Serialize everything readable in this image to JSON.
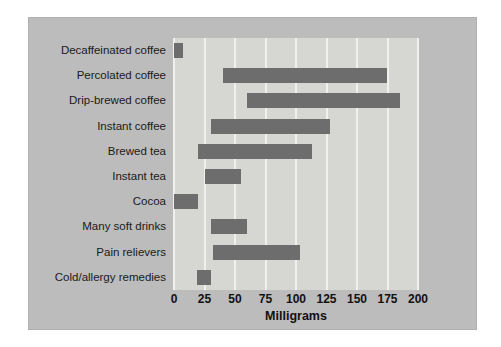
{
  "chart_data": {
    "type": "bar",
    "orientation": "horizontal",
    "subtype": "range-bar",
    "title": "",
    "xlabel": "Milligrams",
    "ylabel": "",
    "xlim": [
      0,
      200
    ],
    "xticks": [
      0,
      25,
      50,
      75,
      100,
      125,
      150,
      175,
      200
    ],
    "xtick_labels": [
      "0",
      "25",
      "50",
      "75",
      "100",
      "125",
      "150",
      "175",
      "200"
    ],
    "grid": true,
    "grid_axis": "x",
    "legend": false,
    "categories": [
      "Decaffeinated coffee",
      "Percolated coffee",
      "Drip-brewed coffee",
      "Instant coffee",
      "Brewed tea",
      "Instant tea",
      "Cocoa",
      "Many soft drinks",
      "Pain relievers",
      "Cold/allergy remedies"
    ],
    "ranges": [
      {
        "category": "Decaffeinated coffee",
        "start": 0,
        "end": 7
      },
      {
        "category": "Percolated coffee",
        "start": 40,
        "end": 175
      },
      {
        "category": "Drip-brewed coffee",
        "start": 60,
        "end": 185
      },
      {
        "category": "Instant coffee",
        "start": 30,
        "end": 128
      },
      {
        "category": "Brewed tea",
        "start": 20,
        "end": 113
      },
      {
        "category": "Instant tea",
        "start": 25,
        "end": 55
      },
      {
        "category": "Cocoa",
        "start": 0,
        "end": 20
      },
      {
        "category": "Many soft drinks",
        "start": 30,
        "end": 60
      },
      {
        "category": "Pain relievers",
        "start": 32,
        "end": 103
      },
      {
        "category": "Cold/allergy remedies",
        "start": 19,
        "end": 30
      }
    ],
    "colors": {
      "bar": "#6d6d6d",
      "plot_background": "#d6d6d2",
      "panel_background": "#bcbcbc",
      "gridline": "#f0f0ec",
      "text": "#111111"
    }
  }
}
